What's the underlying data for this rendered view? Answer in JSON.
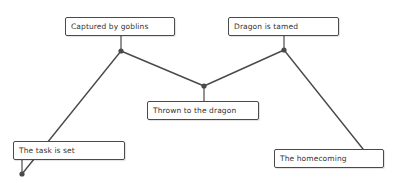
{
  "diagram": {
    "type": "story-arc-timeline",
    "line_color": "#4a4a4a",
    "box_border_color": "#4a4a4a",
    "background": "#ffffff",
    "events": [
      {
        "id": "task-set",
        "label": "The task is set",
        "box": {
          "x": 13,
          "y": 141,
          "w": 112,
          "h": 19
        },
        "point": {
          "x": 22,
          "y": 174
        }
      },
      {
        "id": "captured",
        "label": "Captured by goblins",
        "box": {
          "x": 65,
          "y": 17,
          "w": 110,
          "h": 19
        },
        "point": {
          "x": 121,
          "y": 51
        }
      },
      {
        "id": "thrown",
        "label": "Thrown to the dragon",
        "box": {
          "x": 147,
          "y": 101,
          "w": 112,
          "h": 19
        },
        "point": {
          "x": 204,
          "y": 86
        }
      },
      {
        "id": "tamed",
        "label": "Dragon is tamed",
        "box": {
          "x": 228,
          "y": 17,
          "w": 111,
          "h": 19
        },
        "point": {
          "x": 284,
          "y": 50
        }
      },
      {
        "id": "homecoming",
        "label": "The homecoming",
        "box": {
          "x": 274,
          "y": 149,
          "w": 110,
          "h": 19
        },
        "point": {
          "x": 363,
          "y": 149
        }
      }
    ]
  }
}
